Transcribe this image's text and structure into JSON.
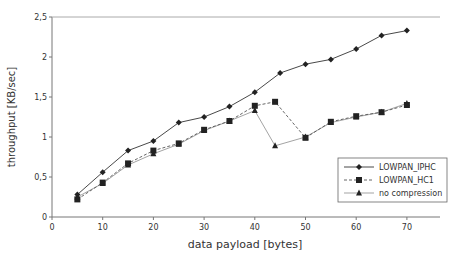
{
  "chart_data": {
    "type": "line",
    "title": "",
    "xlabel": "data payload [bytes]",
    "ylabel": "throughput [KB/sec]",
    "xlim": [
      0,
      76
    ],
    "ylim": [
      0,
      2.5
    ],
    "x_ticks": [
      0,
      10,
      20,
      30,
      40,
      50,
      60,
      70
    ],
    "x_tick_labels": [
      "0",
      "10",
      "20",
      "30",
      "40",
      "50",
      "60",
      "70"
    ],
    "y_ticks": [
      0,
      0.5,
      1,
      1.5,
      2,
      2.5
    ],
    "y_tick_labels": [
      "0",
      "0,5",
      "1",
      "1,5",
      "2",
      "2,5"
    ],
    "grid": false,
    "legend_position": "lower right",
    "series": [
      {
        "name": "LOWPAN_IPHC",
        "marker": "diamond",
        "line": "solid",
        "color": "#333333",
        "x": [
          5,
          10,
          15,
          20,
          25,
          30,
          35,
          40,
          45,
          50,
          55,
          60,
          65,
          70
        ],
        "values": [
          0.28,
          0.56,
          0.83,
          0.95,
          1.18,
          1.25,
          1.38,
          1.56,
          1.8,
          1.91,
          1.97,
          2.1,
          2.27,
          2.33
        ]
      },
      {
        "name": "LOWPAN_HC1",
        "marker": "square",
        "line": "dashed",
        "color": "#444444",
        "x": [
          5,
          10,
          15,
          20,
          25,
          30,
          35,
          40,
          44,
          50,
          55,
          60,
          65,
          70
        ],
        "values": [
          0.22,
          0.43,
          0.67,
          0.83,
          0.92,
          1.09,
          1.2,
          1.39,
          1.44,
          0.99,
          1.19,
          1.26,
          1.31,
          1.4
        ]
      },
      {
        "name": "no compression",
        "marker": "triangle",
        "line": "solid-light",
        "color": "#888888",
        "x": [
          5,
          10,
          15,
          20,
          25,
          30,
          35,
          40,
          44,
          50,
          55,
          60,
          65,
          70
        ],
        "values": [
          0.25,
          0.42,
          0.65,
          0.79,
          0.91,
          1.08,
          1.2,
          1.33,
          0.89,
          1.0,
          1.18,
          1.25,
          1.31,
          1.42
        ]
      }
    ]
  }
}
